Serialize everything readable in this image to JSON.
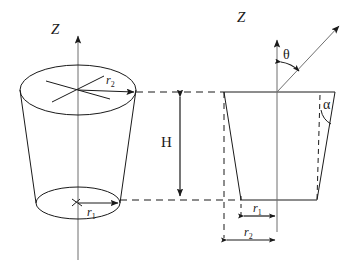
{
  "figure": {
    "stroke_color": "#1a1a1a",
    "background_color": "#ffffff"
  },
  "labels": {
    "axis_z_left": "Z",
    "axis_z_right": "Z",
    "height": "H",
    "theta": "θ",
    "alpha": "α",
    "r1": "r",
    "r1_sub": "1",
    "r2": "r",
    "r2_sub": "2"
  },
  "left_view": {
    "name": "3d-frustum",
    "axis_label": "Z",
    "top_radius_label": "r2",
    "bottom_radius_label": "r1",
    "top_ellipse": {
      "cx": 78,
      "cy": 90,
      "rx": 58,
      "ry": 25
    },
    "bottom_ellipse": {
      "cx": 78,
      "cy": 203,
      "rx": 42,
      "ry": 16
    }
  },
  "right_view": {
    "name": "cross-section-trapezoid",
    "axis_label": "Z",
    "angle_from_axis": "θ",
    "wall_angle": "α",
    "inner_radius_label": "r1",
    "outer_radius_label": "r2",
    "trapezoid": {
      "top_left": [
        224,
        92
      ],
      "top_right": [
        335,
        92
      ],
      "bottom_right": [
        317,
        200
      ],
      "bottom_left": [
        241,
        200
      ]
    }
  },
  "dimensions": {
    "height_label": "H",
    "height_from_y": 92,
    "height_to_y": 200
  }
}
